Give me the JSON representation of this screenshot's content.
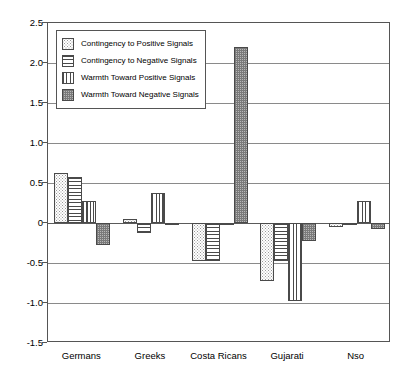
{
  "chart_data": {
    "type": "bar",
    "title": "",
    "xlabel": "",
    "ylabel": "",
    "ylim": [
      -1.5,
      2.5
    ],
    "ytick_step": 0.5,
    "grid": true,
    "legend_position": "top-left inside plot",
    "categories": [
      "Germans",
      "Greeks",
      "Costa Ricans",
      "Gujarati",
      "Nso"
    ],
    "ytick_labels": [
      "2.5",
      "2.0",
      "1.5",
      "1.0",
      "0.5",
      "0",
      "-0.5",
      "-1.0",
      "-1.5"
    ],
    "ytick_values": [
      2.5,
      2.0,
      1.5,
      1.0,
      0.5,
      0,
      -0.5,
      -1.0,
      -1.5
    ],
    "series": [
      {
        "name": "Contingency to Positive Signals",
        "pattern": "dots",
        "values": [
          0.63,
          0.05,
          -0.48,
          -0.73,
          -0.05
        ]
      },
      {
        "name": "Contingency to Negative Signals",
        "pattern": "horizontal-lines",
        "values": [
          0.57,
          -0.13,
          -0.48,
          -0.48,
          -0.03
        ]
      },
      {
        "name": "Warmth Toward Positive Signals",
        "pattern": "vertical-lines",
        "values": [
          0.28,
          0.37,
          -0.03,
          -0.98,
          0.28
        ]
      },
      {
        "name": "Warmth Toward Negative Signals",
        "pattern": "dense-cross",
        "values": [
          -0.27,
          -0.02,
          2.2,
          -0.22,
          -0.08
        ]
      }
    ]
  },
  "colors": {
    "frame": "#555555",
    "gridline": "#8a8a8a",
    "bar_outline": "#4a4a4a",
    "background": "#ffffff"
  }
}
